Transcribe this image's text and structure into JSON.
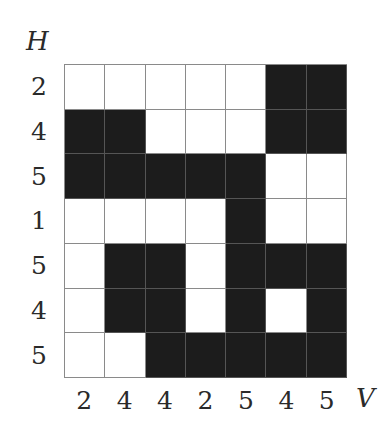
{
  "axes": {
    "row_axis_label": "H",
    "col_axis_label": "V"
  },
  "row_sums": [
    "2",
    "4",
    "5",
    "1",
    "5",
    "4",
    "5"
  ],
  "col_sums": [
    "2",
    "4",
    "4",
    "2",
    "5",
    "4",
    "5"
  ],
  "grid": [
    [
      0,
      0,
      0,
      0,
      0,
      1,
      1
    ],
    [
      1,
      1,
      0,
      0,
      0,
      1,
      1
    ],
    [
      1,
      1,
      1,
      1,
      1,
      0,
      0
    ],
    [
      0,
      0,
      0,
      0,
      1,
      0,
      0
    ],
    [
      0,
      1,
      1,
      0,
      1,
      1,
      1
    ],
    [
      0,
      1,
      1,
      0,
      1,
      0,
      1
    ],
    [
      0,
      0,
      1,
      1,
      1,
      1,
      1
    ]
  ],
  "colors": {
    "filled": "#1c1c1c",
    "empty": "#ffffff",
    "gridline": "#8a8a8a"
  }
}
